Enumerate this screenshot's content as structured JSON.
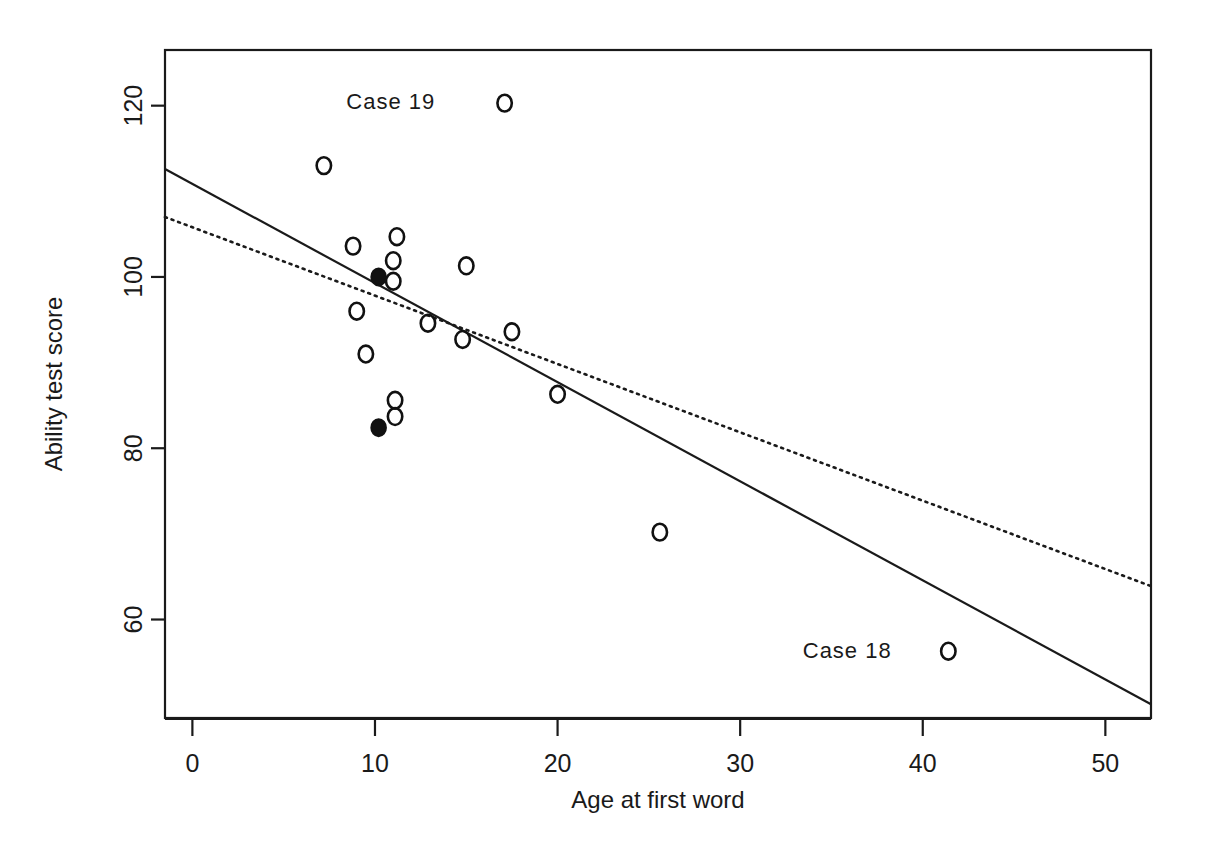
{
  "chart_data": {
    "type": "scatter",
    "title": "",
    "xlabel": "Age at first word",
    "ylabel": "Ability test score",
    "xlim": [
      -1.5,
      52.5
    ],
    "ylim": [
      48.5,
      126.5
    ],
    "xticks": [
      0,
      10,
      20,
      30,
      40,
      50
    ],
    "xtick_labels": [
      "0",
      "10",
      "20",
      "30",
      "40",
      "50"
    ],
    "yticks": [
      60,
      80,
      100,
      120
    ],
    "ytick_labels": [
      "60",
      "80",
      "100",
      "120"
    ],
    "grid": false,
    "legend": false,
    "points": [
      {
        "x": 7.2,
        "y": 113.0,
        "style": "open"
      },
      {
        "x": 17.1,
        "y": 120.3,
        "style": "open"
      },
      {
        "x": 8.8,
        "y": 103.6,
        "style": "open"
      },
      {
        "x": 11.2,
        "y": 104.7,
        "style": "open"
      },
      {
        "x": 11.0,
        "y": 101.9,
        "style": "open"
      },
      {
        "x": 15.0,
        "y": 101.3,
        "style": "open"
      },
      {
        "x": 10.2,
        "y": 100.0,
        "style": "filled"
      },
      {
        "x": 11.0,
        "y": 99.5,
        "style": "open"
      },
      {
        "x": 9.0,
        "y": 96.0,
        "style": "open"
      },
      {
        "x": 12.9,
        "y": 94.6,
        "style": "open"
      },
      {
        "x": 14.8,
        "y": 92.7,
        "style": "open"
      },
      {
        "x": 17.5,
        "y": 93.6,
        "style": "open"
      },
      {
        "x": 9.5,
        "y": 91.0,
        "style": "open"
      },
      {
        "x": 11.1,
        "y": 85.6,
        "style": "open"
      },
      {
        "x": 11.1,
        "y": 83.7,
        "style": "open"
      },
      {
        "x": 10.2,
        "y": 82.4,
        "style": "filled"
      },
      {
        "x": 20.0,
        "y": 86.3,
        "style": "open"
      },
      {
        "x": 25.6,
        "y": 70.2,
        "style": "open"
      },
      {
        "x": 41.4,
        "y": 56.3,
        "style": "open"
      }
    ],
    "lines": [
      {
        "name": "regression-all-cases",
        "style": "solid",
        "x": [
          -1.5,
          52.5
        ],
        "y": [
          112.6,
          50.1
        ]
      },
      {
        "name": "regression-excluding-outliers",
        "style": "dotted",
        "x": [
          -1.5,
          52.5
        ],
        "y": [
          107.0,
          63.9
        ]
      }
    ],
    "annotations": [
      {
        "text": "Case 19",
        "x": 13.3,
        "y": 120.6,
        "anchor": "end"
      },
      {
        "text": "Case 18",
        "x": 38.3,
        "y": 56.4,
        "anchor": "end"
      }
    ]
  }
}
